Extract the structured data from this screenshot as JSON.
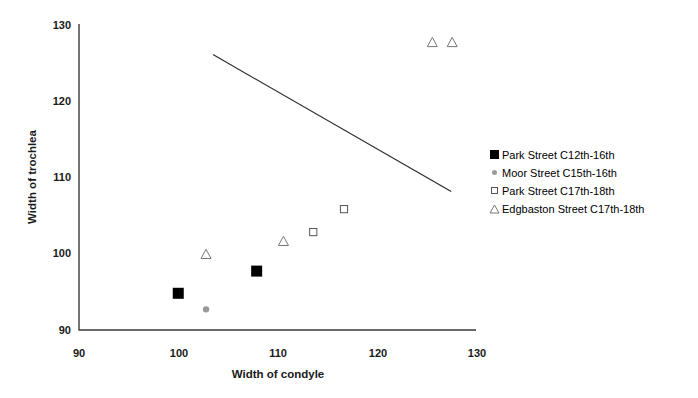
{
  "chart_data": {
    "type": "scatter",
    "title": "",
    "xlabel": "Width of condyle",
    "ylabel": "Width of trochlea",
    "xlim": [
      90,
      130
    ],
    "ylim": [
      90,
      130
    ],
    "xticks": [
      90,
      100,
      110,
      120,
      130
    ],
    "yticks": [
      90,
      100,
      110,
      120,
      130
    ],
    "xtick_labels": [
      "90",
      "100",
      "110",
      "120",
      "130"
    ],
    "ytick_labels": [
      "90",
      "100",
      "110",
      "120",
      "130"
    ],
    "grid": false,
    "legend_position": "right",
    "series": [
      {
        "name": "Park Street C12th-16th",
        "marker": "filled-square",
        "color": "#000000",
        "points": [
          {
            "x": 100.0,
            "y": 94.8
          },
          {
            "x": 107.9,
            "y": 97.7
          }
        ]
      },
      {
        "name": "Moor Street C15th-16th",
        "marker": "gray-dot",
        "color": "#9a9a9a",
        "points": [
          {
            "x": 102.8,
            "y": 92.7
          }
        ]
      },
      {
        "name": "Park Street C17th-18th",
        "marker": "open-square",
        "color": "#555555",
        "points": [
          {
            "x": 113.6,
            "y": 102.8
          },
          {
            "x": 116.7,
            "y": 105.8
          }
        ]
      },
      {
        "name": "Edgbaston Street C17th-18th",
        "marker": "open-triangle",
        "color": "#777777",
        "points": [
          {
            "x": 102.8,
            "y": 99.9
          },
          {
            "x": 110.6,
            "y": 101.6
          },
          {
            "x": 125.6,
            "y": 127.6
          },
          {
            "x": 127.6,
            "y": 127.6
          }
        ]
      }
    ],
    "reference_line": {
      "name": "trend-line",
      "x0": 103.5,
      "y0": 126.0,
      "x1": 127.5,
      "y1": 108.1,
      "color": "#2b2b2b"
    }
  },
  "legend": {
    "items": [
      {
        "label": "Park Street C12th-16th",
        "marker": "filled-square"
      },
      {
        "label": "Moor Street C15th-16th",
        "marker": "gray-dot"
      },
      {
        "label": "Park Street C17th-18th",
        "marker": "open-square"
      },
      {
        "label": "Edgbaston Street C17th-18th",
        "marker": "open-triangle"
      }
    ]
  },
  "axes": {
    "x_title": "Width of condyle",
    "y_title": "Width of trochlea",
    "x_ticks": [
      "90",
      "100",
      "110",
      "120",
      "130"
    ],
    "y_ticks": [
      "130",
      "120",
      "110",
      "100",
      "90"
    ]
  }
}
